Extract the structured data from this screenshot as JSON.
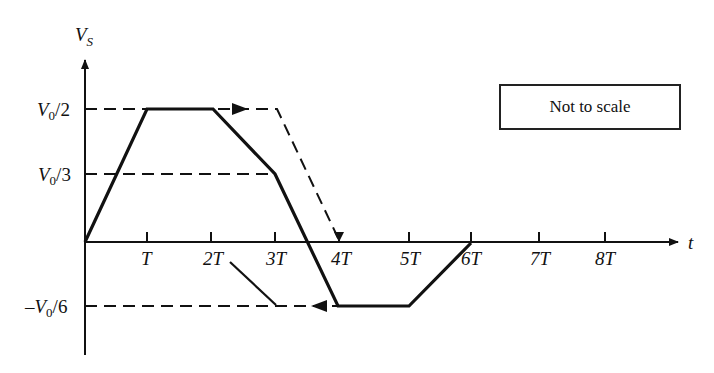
{
  "figure": {
    "y_axis_label": "V",
    "y_axis_label_sub": "S",
    "x_axis_label": "t",
    "note": "Not to scale",
    "y_levels": [
      {
        "label_main": "V",
        "label_sub": "0",
        "label_tail": "/2",
        "value": "V0/2"
      },
      {
        "label_main": "V",
        "label_sub": "0",
        "label_tail": "/3",
        "value": "V0/3"
      },
      {
        "label_main": "–V",
        "label_sub": "0",
        "label_tail": "/6",
        "value": "-V0/6"
      }
    ],
    "x_ticks": [
      "T",
      "2T",
      "3T",
      "4T",
      "5T",
      "6T",
      "7T",
      "8T"
    ],
    "colors": {
      "line": "#111111",
      "background": "#ffffff"
    }
  },
  "diagram_data": {
    "type": "waveform",
    "solid_waveform_points": [
      {
        "t": "0",
        "v": "0"
      },
      {
        "t": "T",
        "v": "V0/2"
      },
      {
        "t": "2T",
        "v": "V0/2"
      },
      {
        "t": "3T",
        "v": "V0/3"
      },
      {
        "t": "4T",
        "v": "-V0/6"
      },
      {
        "t": "5T",
        "v": "-V0/6"
      },
      {
        "t": "~6T",
        "v": "0"
      }
    ],
    "dashed_reflection_paths": [
      {
        "description": "V0/2 level extended with arrow to right, then dashed drop to 4T on the t-axis"
      },
      {
        "description": "V0/3 dashed reference line to 3T"
      },
      {
        "description": "-V0/6 dashed reference line with leftward arrow"
      }
    ]
  }
}
